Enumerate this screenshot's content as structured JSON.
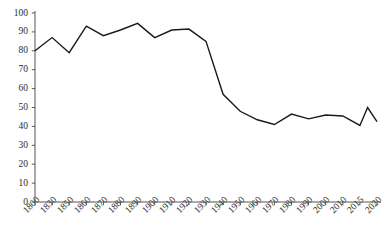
{
  "chart_data": {
    "type": "line",
    "title": "",
    "subtitle": "",
    "xlabel": "",
    "ylabel": "",
    "categories": [
      "1800",
      "1830",
      "1850",
      "1860",
      "1870",
      "1880",
      "1890",
      "1900",
      "1910",
      "1920",
      "1930",
      "1940",
      "1950",
      "1960",
      "1970",
      "1980",
      "1990",
      "2000",
      "2010",
      "2015",
      "2020"
    ],
    "values": [
      80,
      87,
      79,
      93,
      88,
      91,
      94.5,
      87,
      91,
      91.5,
      85,
      57,
      48,
      43.5,
      41,
      46.5,
      44,
      46,
      45.5,
      40.5,
      42.5
    ],
    "extra_points": [
      {
        "label": "spike",
        "x_between": [
          "2015",
          "2020"
        ],
        "x_fraction": 0.45,
        "value": 50
      }
    ],
    "ylim": [
      0,
      100
    ],
    "ytick_values": [
      0,
      10,
      20,
      30,
      40,
      50,
      60,
      70,
      80,
      90,
      100
    ],
    "ytick_labels": [
      "0",
      "10",
      "20",
      "30",
      "40",
      "50",
      "60",
      "70",
      "80",
      "90",
      "100"
    ],
    "grid": false,
    "legend": null,
    "legend_position": "none",
    "line_color": "#1a1a1a",
    "line_width": 1.4,
    "axis_color": "#555555",
    "background_color": "#ffffff",
    "markers": false
  },
  "axes": {
    "y_axis_name": "y-axis",
    "x_axis_name": "x-axis"
  }
}
